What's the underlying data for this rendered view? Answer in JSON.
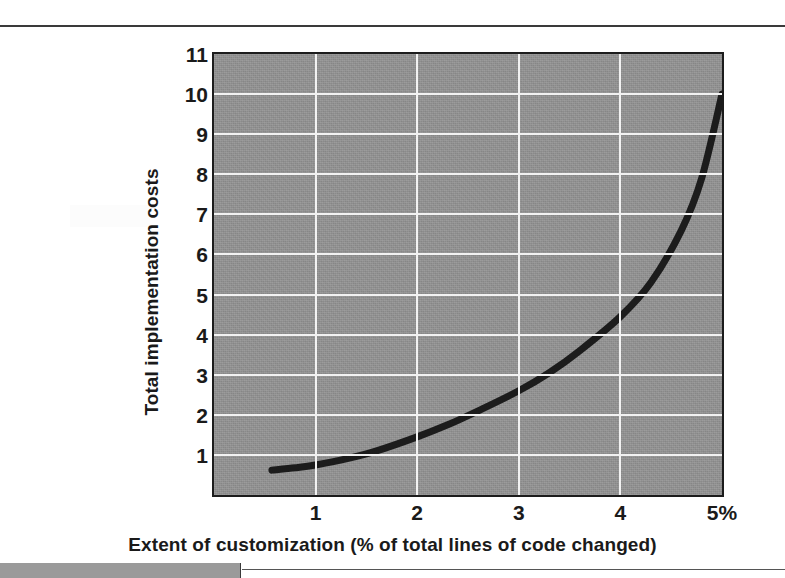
{
  "page": {
    "background_color": "#ffffff",
    "top_rule_color": "#3a3a3a",
    "bottom_bar_color": "#9a9a9a"
  },
  "chart_data": {
    "type": "line",
    "title": "",
    "subtitle": "",
    "xlabel": "Extent of customization (% of total lines of code changed)",
    "ylabel": "Total implementation costs",
    "xlim": [
      0,
      5
    ],
    "ylim": [
      0,
      11
    ],
    "grid": true,
    "legend": false,
    "legend_position": "none",
    "plot_background_color": "#919191",
    "gridline_color": "#f2f2f2",
    "axis_border_color": "#1c1c1c",
    "series_color": "#1c1c1c",
    "x_ticks": [
      {
        "value": 1,
        "label": "1"
      },
      {
        "value": 2,
        "label": "2"
      },
      {
        "value": 3,
        "label": "3"
      },
      {
        "value": 4,
        "label": "4"
      },
      {
        "value": 5,
        "label": "5%"
      }
    ],
    "y_ticks": [
      {
        "value": 11,
        "label": "11"
      },
      {
        "value": 10,
        "label": "10"
      },
      {
        "value": 9,
        "label": "9"
      },
      {
        "value": 8,
        "label": "8"
      },
      {
        "value": 7,
        "label": "7"
      },
      {
        "value": 6,
        "label": "6"
      },
      {
        "value": 5,
        "label": "5"
      },
      {
        "value": 4,
        "label": "4"
      },
      {
        "value": 3,
        "label": "3"
      },
      {
        "value": 2,
        "label": "2"
      },
      {
        "value": 1,
        "label": "1"
      }
    ],
    "series": [
      {
        "name": "Total implementation costs",
        "x": [
          0.57,
          0.8,
          1.0,
          1.3,
          1.6,
          2.0,
          2.3,
          2.6,
          3.0,
          3.3,
          3.6,
          4.0,
          4.3,
          4.6,
          4.8,
          5.0
        ],
        "y": [
          0.62,
          0.68,
          0.75,
          0.9,
          1.1,
          1.45,
          1.75,
          2.1,
          2.6,
          3.05,
          3.6,
          4.45,
          5.3,
          6.6,
          7.9,
          10.0
        ]
      }
    ]
  }
}
